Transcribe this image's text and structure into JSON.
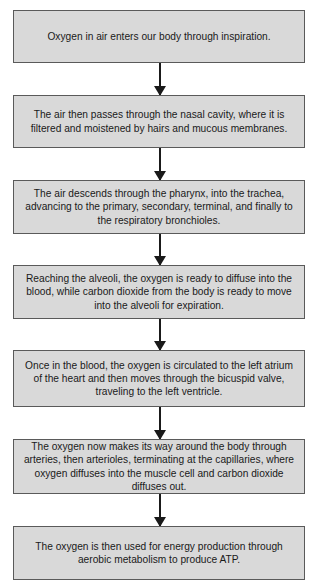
{
  "flowchart": {
    "steps": [
      {
        "text": "Oxygen in air enters our body through inspiration."
      },
      {
        "text": "The air then passes through the nasal cavity, where it is filtered and moistened by hairs and mucous membranes."
      },
      {
        "text": "The air descends through the pharynx, into the trachea, advancing to the primary, secondary, terminal, and finally to the respiratory bronchioles."
      },
      {
        "text": "Reaching the alveoli, the oxygen is ready to diffuse into the blood, while carbon dioxide from the body is ready to move into the alveoli for expiration."
      },
      {
        "text": "Once in the blood, the oxygen is circulated to the left atrium of the heart and then moves through the bicuspid valve, traveling to the left ventricle."
      },
      {
        "text": "The oxygen now makes its way around the body through arteries, then arterioles, terminating at the capillaries, where oxygen diffuses into the muscle cell and carbon dioxide diffuses out."
      },
      {
        "text": "The oxygen is then used for energy production through aerobic metabolism to produce ATP."
      }
    ],
    "colors": {
      "box_fill": "#d9d9d9",
      "box_border": "#5a5a5a",
      "arrow": "#1a1a1a"
    }
  }
}
